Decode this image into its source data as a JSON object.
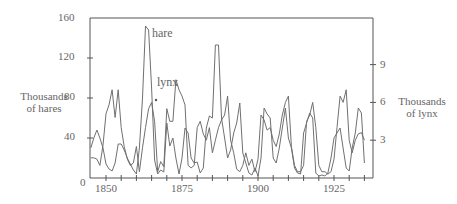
{
  "chart_data": {
    "type": "line",
    "title": "",
    "xlabel": "",
    "ylabel_left": "Thousands of hares",
    "ylabel_right": "Thousands of lynx",
    "x_ticks": [
      1850,
      1875,
      1900,
      1925
    ],
    "y_left_ticks": [
      0,
      40,
      80,
      120,
      160
    ],
    "y_right_ticks": [
      3,
      6,
      9
    ],
    "ylim_left": [
      0,
      160
    ],
    "ylim_right": [
      0,
      12.7
    ],
    "xlim": [
      1845,
      1935
    ],
    "grid": false,
    "annotations": [
      "hare",
      "lynx"
    ],
    "x": [
      1845,
      1846,
      1847,
      1848,
      1849,
      1850,
      1851,
      1852,
      1853,
      1854,
      1855,
      1856,
      1857,
      1858,
      1859,
      1860,
      1861,
      1862,
      1863,
      1864,
      1865,
      1866,
      1867,
      1868,
      1869,
      1870,
      1871,
      1872,
      1873,
      1874,
      1875,
      1876,
      1877,
      1878,
      1879,
      1880,
      1881,
      1882,
      1883,
      1884,
      1885,
      1886,
      1887,
      1888,
      1889,
      1890,
      1891,
      1892,
      1893,
      1894,
      1895,
      1896,
      1897,
      1898,
      1899,
      1900,
      1901,
      1902,
      1903,
      1904,
      1905,
      1906,
      1907,
      1908,
      1909,
      1910,
      1911,
      1912,
      1913,
      1914,
      1915,
      1916,
      1917,
      1918,
      1919,
      1920,
      1921,
      1922,
      1923,
      1924,
      1925,
      1926,
      1927,
      1928,
      1929,
      1930,
      1931,
      1932,
      1933,
      1934,
      1935
    ],
    "series": [
      {
        "name": "hare",
        "axis": "left",
        "values": [
          30,
          40,
          48,
          40,
          30,
          14,
          9,
          7,
          15,
          34,
          34,
          28,
          20,
          14,
          8,
          4,
          30,
          80,
          152,
          148,
          90,
          18,
          4,
          8,
          6,
          55,
          32,
          40,
          20,
          4,
          20,
          50,
          45,
          20,
          15,
          16,
          5,
          10,
          50,
          62,
          60,
          133,
          133,
          60,
          40,
          20,
          28,
          45,
          55,
          75,
          25,
          15,
          5,
          3,
          10,
          2,
          20,
          70,
          64,
          60,
          20,
          15,
          30,
          50,
          70,
          40,
          30,
          10,
          5,
          4,
          45,
          55,
          65,
          60,
          5,
          2,
          3,
          2,
          5,
          20,
          40,
          45,
          50,
          30,
          10,
          7,
          30,
          45,
          70,
          65,
          15
        ]
      },
      {
        "name": "lynx",
        "axis": "right",
        "values": [
          1.6,
          1.6,
          1.5,
          1.0,
          2.6,
          5.1,
          5.8,
          7.0,
          4.8,
          7.0,
          4.0,
          2.5,
          1.5,
          1.0,
          1.2,
          2.5,
          0.5,
          2.4,
          4.0,
          5.5,
          6.0,
          4.5,
          0.5,
          1.3,
          0.9,
          5.5,
          4.5,
          4.5,
          7.8,
          7.0,
          6.5,
          5.8,
          1.0,
          0.8,
          1.0,
          4.0,
          4.5,
          3.5,
          3.0,
          4.0,
          2.0,
          3.0,
          4.0,
          4.6,
          5.0,
          6.5,
          3.0,
          2.0,
          0.7,
          0.5,
          1.0,
          2.0,
          1.0,
          1.5,
          0.5,
          1.5,
          5.0,
          4.6,
          3.8,
          4.0,
          3.0,
          2.5,
          3.5,
          5.0,
          6.0,
          6.5,
          2.5,
          1.0,
          0.5,
          0.5,
          1.0,
          4.5,
          5.0,
          6.0,
          4.0,
          1.0,
          0.5,
          0.5,
          0.3,
          0.5,
          1.5,
          4.0,
          6.5,
          6.0,
          7.0,
          3.0,
          2.0,
          3.0,
          3.5,
          3.6,
          3.0
        ]
      }
    ]
  },
  "labels": {
    "left_axis_line1": "Thousands",
    "left_axis_line2": "of hares",
    "right_axis_line1": "Thousands",
    "right_axis_line2": "of lynx",
    "hare_annotation": "hare",
    "lynx_annotation": "lynx",
    "zero": "0",
    "y160": "160",
    "y120": "120",
    "y80": "80",
    "y40": "40",
    "r9": "9",
    "r6": "6",
    "r3": "3",
    "x1850": "1850",
    "x1875": "1875",
    "x1900": "1900",
    "x1925": "1925"
  },
  "colors": {
    "line": "#707070",
    "axis": "#555555",
    "text": "#666666"
  }
}
